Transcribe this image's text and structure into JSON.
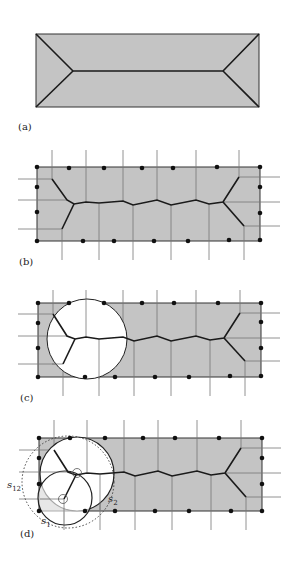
{
  "panels": {
    "a": {
      "label": "(a)"
    },
    "b": {
      "label": "(b)"
    },
    "c": {
      "label": "(c)"
    },
    "d": {
      "label": "(d)"
    }
  },
  "annotations": {
    "s12": {
      "base": "s",
      "sub": "12"
    },
    "s2": {
      "base": "s",
      "sub": "2"
    },
    "s1": {
      "base": "s",
      "sub": "1"
    }
  },
  "colors": {
    "fill": "#c4c4c4",
    "edge": "#1a1a1a",
    "grid": "#777777",
    "disk": "#ffffff"
  }
}
